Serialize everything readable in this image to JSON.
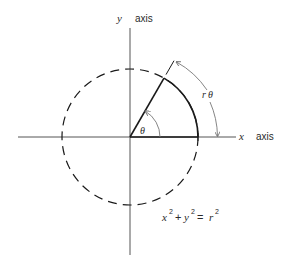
{
  "labels": {
    "y_var": "y",
    "y_axis": "axis",
    "x_var": "x",
    "x_axis": "axis",
    "theta": "θ",
    "arc_r": "r",
    "arc_theta": "θ",
    "equation": {
      "x": "x",
      "x_exp": "2",
      "plus": "+",
      "y": "y",
      "y_exp": "2",
      "eq": "=",
      "r": "r",
      "r_exp": "2"
    }
  },
  "geometry": {
    "origin": [
      130,
      137
    ],
    "radius": 68,
    "angle_deg": 60,
    "circle_style": "dashed"
  },
  "colors": {
    "stroke": "#1a1a1a",
    "axis": "#555555",
    "arrow": "#777777"
  }
}
